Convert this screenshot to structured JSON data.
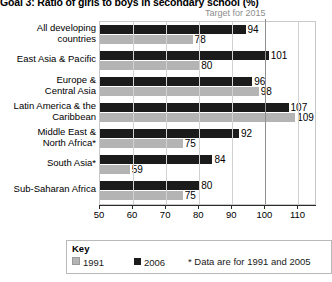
{
  "chart_data": {
    "type": "bar",
    "orientation": "horizontal",
    "title": "Goal 3: Ratio of girls to boys in secondary school (%)",
    "xlabel": "",
    "ylabel": "",
    "xlim": [
      50,
      115
    ],
    "xticks": [
      50,
      60,
      70,
      80,
      90,
      100,
      110
    ],
    "xtick_labels": [
      "50",
      "60",
      "70",
      "80",
      "90",
      "100",
      "110"
    ],
    "grid": true,
    "legend_position": "bottom",
    "categories": [
      "All developing countries",
      "East Asia & Pacific",
      "Europe & Central Asia",
      "Latin America & the Caribbean",
      "Middle East & North Africa*",
      "South Asia*",
      "Sub-Saharan Africa"
    ],
    "category_lines": [
      [
        "All developing",
        "countries"
      ],
      [
        "East Asia & Pacific"
      ],
      [
        "Europe &",
        "Central Asia"
      ],
      [
        "Latin America & the",
        "Caribbean"
      ],
      [
        "Middle East &",
        "North Africa*"
      ],
      [
        "South Asia*"
      ],
      [
        "Sub-Saharan Africa"
      ]
    ],
    "series": [
      {
        "name": "1991",
        "color": "#b4b4b4",
        "values": [
          78,
          80,
          98,
          109,
          75,
          59,
          75
        ]
      },
      {
        "name": "2006",
        "color": "#1b1b1b",
        "values": [
          94,
          101,
          96,
          107,
          92,
          84,
          80
        ]
      }
    ],
    "annotations": [
      {
        "name": "target-for-2015",
        "text": "Target for 2015",
        "value": 100,
        "color": "#8d8d8d"
      }
    ]
  },
  "legend": {
    "title": "Key",
    "entries": [
      {
        "label": "1991",
        "color": "#b4b4b4"
      },
      {
        "label": "2006",
        "color": "#1b1b1b"
      }
    ],
    "note": "* Data are for 1991 and 2005"
  }
}
